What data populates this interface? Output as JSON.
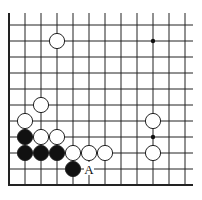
{
  "board": {
    "origin_x": 9,
    "origin_y": 25,
    "spacing": 16,
    "cols": 12,
    "rows": 11,
    "line_color": "#222222",
    "edges": {
      "left": true,
      "bottom": true,
      "top": false,
      "right": false
    }
  },
  "star_points": [
    [
      9,
      1
    ],
    [
      9,
      7
    ]
  ],
  "stones": [
    {
      "color": "white",
      "col": 3,
      "row": 1
    },
    {
      "color": "white",
      "col": 2,
      "row": 5
    },
    {
      "color": "white",
      "col": 1,
      "row": 6
    },
    {
      "color": "white",
      "col": 9,
      "row": 6
    },
    {
      "color": "black",
      "col": 1,
      "row": 7
    },
    {
      "color": "white",
      "col": 2,
      "row": 7
    },
    {
      "color": "white",
      "col": 3,
      "row": 7
    },
    {
      "color": "black",
      "col": 1,
      "row": 8
    },
    {
      "color": "black",
      "col": 2,
      "row": 8
    },
    {
      "color": "black",
      "col": 3,
      "row": 8
    },
    {
      "color": "white",
      "col": 4,
      "row": 8
    },
    {
      "color": "white",
      "col": 5,
      "row": 8
    },
    {
      "color": "white",
      "col": 6,
      "row": 8
    },
    {
      "color": "white",
      "col": 9,
      "row": 8
    },
    {
      "color": "black",
      "col": 4,
      "row": 9
    }
  ],
  "labels": [
    {
      "text": "A",
      "col": 5,
      "row": 9
    }
  ]
}
